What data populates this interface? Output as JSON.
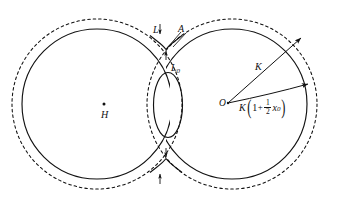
{
  "figure": {
    "type": "geometric-diagram",
    "canvas": {
      "width": 338,
      "height": 210,
      "background": "#ffffff"
    },
    "stroke_color": "#111111",
    "labels": {
      "L": "L",
      "A": "A",
      "L0_base": "L",
      "L0_sub": "0",
      "H": "H",
      "O": "O",
      "K": "K"
    },
    "formula": {
      "lead": "K",
      "open_paren": "(",
      "one": "1",
      "plus": "+",
      "numerator": "1",
      "denominator": "2",
      "variable": "x",
      "variable_sub": "0",
      "close_paren": ")"
    },
    "geometry": {
      "solid_circle_left": {
        "cx": 97,
        "cy": 104,
        "r": 75
      },
      "solid_circle_right": {
        "cx": 232,
        "cy": 104,
        "r": 75
      },
      "dashed_circle_left": {
        "cx": 97,
        "cy": 104,
        "r": 85
      },
      "dashed_circle_right": {
        "cx": 232,
        "cy": 104,
        "r": 85
      },
      "center_oval": {
        "cx": 168,
        "cy": 105,
        "rx": 14,
        "ry": 32
      },
      "point_H": {
        "x": 104,
        "y": 104
      },
      "point_O": {
        "x": 228,
        "y": 103
      },
      "arrow_K_end": {
        "x": 301,
        "y": 38
      },
      "arrow_outer_end": {
        "x": 309,
        "y": 84
      },
      "cusp_top": {
        "x": 166,
        "y": 49
      },
      "cusp_bottom": {
        "x": 166,
        "y": 159
      }
    }
  }
}
